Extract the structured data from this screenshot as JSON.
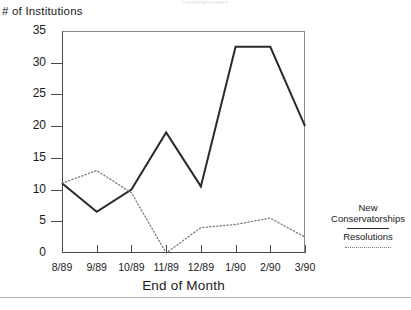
{
  "header": {
    "faint_top_text": "CONSERVATORSHIPS"
  },
  "axis": {
    "y_title": "# of Institutions",
    "x_title": "End of Month",
    "y_ticks": [
      "0",
      "5",
      "10",
      "15",
      "20",
      "25",
      "30",
      "35"
    ],
    "x_ticks": [
      "8/89",
      "9/89",
      "10/89",
      "11/89",
      "12/89",
      "1/90",
      "2/90",
      "3/90"
    ]
  },
  "legend": {
    "series1_line1": "New",
    "series1_line2": "Conservatorships",
    "series2": "Resolutions"
  },
  "colors": {
    "series1": "#2a2a2a",
    "series2": "#7d7d7d",
    "axis": "#4a4a4a",
    "frame": "#8a8a8a"
  },
  "chart_data": {
    "type": "line",
    "title": "",
    "xlabel": "End of Month",
    "ylabel": "# of Institutions",
    "ylim": [
      0,
      35
    ],
    "ytick_step": 5,
    "grid": false,
    "legend_position": "right",
    "categories": [
      "8/89",
      "9/89",
      "10/89",
      "11/89",
      "12/89",
      "1/90",
      "2/90",
      "3/90"
    ],
    "series": [
      {
        "name": "New Conservatorships",
        "style": "solid",
        "color": "#2a2a2a",
        "values": [
          11,
          6.5,
          10,
          19,
          10.5,
          32.5,
          32.5,
          20
        ]
      },
      {
        "name": "Resolutions",
        "style": "dotted",
        "color": "#7d7d7d",
        "values": [
          11,
          13,
          9.5,
          0,
          4,
          4.5,
          5.5,
          2.5
        ]
      }
    ]
  }
}
